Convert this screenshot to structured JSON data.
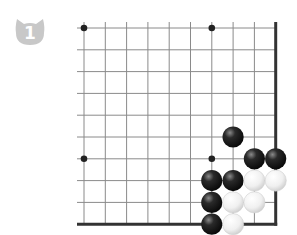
{
  "header": {
    "text": ""
  },
  "problem": {
    "number": "1",
    "badge_color": "#c8c8c8",
    "badge_shape": "cat-head"
  },
  "board": {
    "view": "lower-right corner",
    "columns": 10,
    "rows": 10,
    "origin_x": 84,
    "origin_y": 28,
    "spacing_x": 21.3,
    "spacing_y": 21.8,
    "line_color": "#8a8a8a",
    "edge_color": "#333333",
    "hoshi": [
      [
        0,
        0
      ],
      [
        6,
        0
      ],
      [
        0,
        6
      ],
      [
        6,
        6
      ]
    ],
    "stones": [
      {
        "color": "black",
        "col": 7,
        "row": 5
      },
      {
        "color": "black",
        "col": 8,
        "row": 6
      },
      {
        "color": "black",
        "col": 9,
        "row": 6
      },
      {
        "color": "black",
        "col": 6,
        "row": 7
      },
      {
        "color": "black",
        "col": 7,
        "row": 7
      },
      {
        "color": "white",
        "col": 8,
        "row": 7
      },
      {
        "color": "white",
        "col": 9,
        "row": 7
      },
      {
        "color": "black",
        "col": 6,
        "row": 8
      },
      {
        "color": "white",
        "col": 7,
        "row": 8
      },
      {
        "color": "white",
        "col": 8,
        "row": 8
      },
      {
        "color": "black",
        "col": 6,
        "row": 9
      },
      {
        "color": "white",
        "col": 7,
        "row": 9
      }
    ]
  }
}
